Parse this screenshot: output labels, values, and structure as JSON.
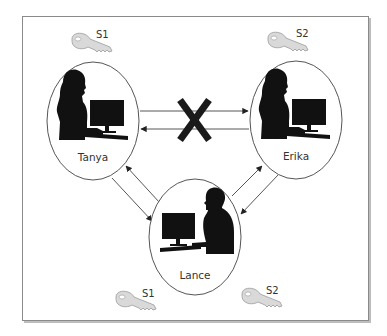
{
  "diagram": {
    "title": "",
    "nodes": [
      {
        "id": "tanya",
        "label": "Tanya",
        "figure": "woman-at-computer",
        "cx": 93,
        "cy": 121
      },
      {
        "id": "erika",
        "label": "Erika",
        "figure": "woman-at-computer",
        "cx": 296,
        "cy": 120
      },
      {
        "id": "lance",
        "label": "Lance",
        "figure": "man-at-computer",
        "cx": 195,
        "cy": 237
      }
    ],
    "keys": [
      {
        "id": "key-tanya",
        "label": "S1",
        "owner": "Tanya",
        "icon": "key-icon"
      },
      {
        "id": "key-erika",
        "label": "S2",
        "owner": "Erika",
        "icon": "key-icon"
      },
      {
        "id": "key-lance-1",
        "label": "S1",
        "owner": "Lance",
        "icon": "key-icon"
      },
      {
        "id": "key-lance-2",
        "label": "S2",
        "owner": "Lance",
        "icon": "key-icon"
      }
    ],
    "edges": [
      {
        "from": "Tanya",
        "to": "Erika",
        "status": "blocked"
      },
      {
        "from": "Erika",
        "to": "Tanya",
        "status": "blocked"
      },
      {
        "from": "Tanya",
        "to": "Lance",
        "status": "allowed"
      },
      {
        "from": "Lance",
        "to": "Tanya",
        "status": "allowed"
      },
      {
        "from": "Lance",
        "to": "Erika",
        "status": "allowed"
      },
      {
        "from": "Erika",
        "to": "Lance",
        "status": "allowed"
      }
    ],
    "blocked_marker": "X"
  }
}
